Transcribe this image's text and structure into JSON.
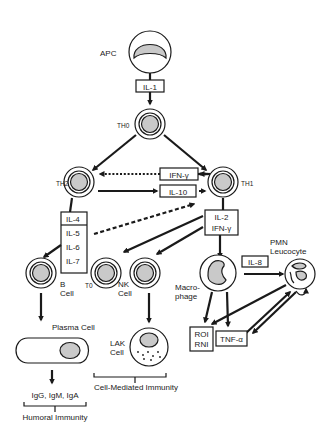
{
  "diagram": {
    "nodes": {
      "apc": "APC",
      "th0": "TH0",
      "th2": "TH2",
      "th1": "TH1",
      "b_cell_line1": "B",
      "b_cell_line2": "Cell",
      "t0": "T0",
      "nk_line1": "NK",
      "nk_line2": "Cell",
      "macrophage_line1": "Macro-",
      "macrophage_line2": "phage",
      "pmn_line1": "PMN",
      "pmn_line2": "Leucocyte",
      "plasma_cell": "Plasma Cell",
      "lak_line1": "LAK",
      "lak_line2": "Cell"
    },
    "cytokine_boxes": {
      "il1": "IL-1",
      "ifn_gamma": "IFN-γ",
      "il10": "IL-10",
      "th2_cytokines": [
        "IL-4",
        "IL-5",
        "IL-6",
        "IL-7"
      ],
      "th1_cytokines": [
        "IL-2",
        "IFN-γ"
      ],
      "il8": "IL-8",
      "roi_rni": [
        "ROI",
        "RNI"
      ],
      "tnf_alpha": "TNF-α"
    },
    "outputs": {
      "immunoglobulins": "IgG, IgM, IgA",
      "humoral": "Humoral Immunity",
      "cell_mediated": "Cell-Mediated Immunity"
    }
  }
}
